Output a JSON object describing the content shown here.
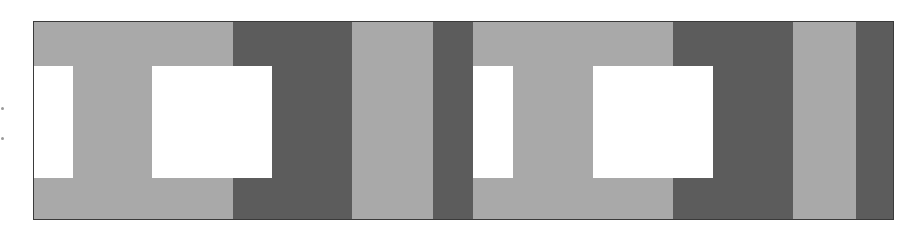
{
  "figure": {
    "colors": {
      "light": "#a9a9a9",
      "dark": "#5c5c5c",
      "white": "#ffffff",
      "border": "#3a3a3a"
    },
    "bands": [
      {
        "tone": "light",
        "x": 0,
        "w": 199
      },
      {
        "tone": "dark",
        "x": 199,
        "w": 119
      },
      {
        "tone": "light",
        "x": 318,
        "w": 81
      },
      {
        "tone": "dark",
        "x": 399,
        "w": 40
      },
      {
        "tone": "light",
        "x": 439,
        "w": 200
      },
      {
        "tone": "dark",
        "x": 639,
        "w": 120
      },
      {
        "tone": "light",
        "x": 759,
        "w": 63
      },
      {
        "tone": "dark",
        "x": 822,
        "w": 39
      }
    ],
    "rects": [
      {
        "x": 0,
        "y": 44,
        "w": 39,
        "h": 112
      },
      {
        "x": 118,
        "y": 44,
        "w": 120,
        "h": 112
      },
      {
        "x": 439,
        "y": 44,
        "w": 40,
        "h": 112
      },
      {
        "x": 559,
        "y": 44,
        "w": 120,
        "h": 112
      }
    ],
    "margin_marks": [
      {
        "x": 1,
        "y": 107
      },
      {
        "x": 1,
        "y": 137
      }
    ]
  }
}
